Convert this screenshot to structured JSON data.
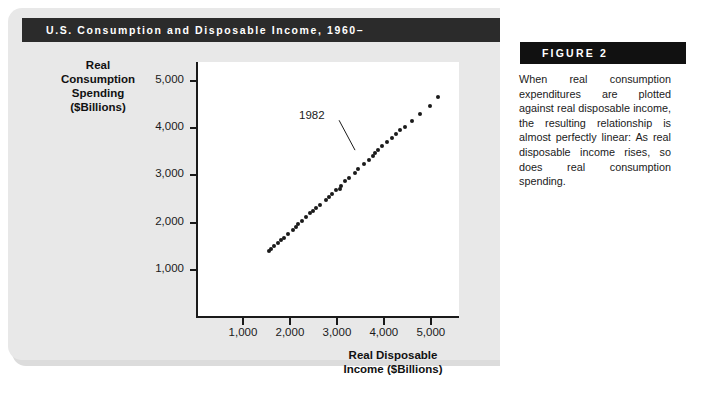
{
  "figure": {
    "title": "U.S. Consumption and Disposable Income, 1960–",
    "label": "FIGURE 2",
    "caption": "When real consumption expenditures are plotted against real disposable income, the resulting relationship is almost perfectly linear: As real disposable income rises, so does real consumption spending."
  },
  "chart_data": {
    "type": "scatter",
    "title": "U.S. Consumption and Disposable Income, 1960–",
    "xlabel": "Real Disposable Income ($Billions)",
    "ylabel": "Real Consumption Spending ($Billions)",
    "xlim": [
      0,
      5600
    ],
    "ylim": [
      0,
      5400
    ],
    "xticks": [
      1000,
      2000,
      3000,
      4000,
      5000
    ],
    "yticks": [
      1000,
      2000,
      3000,
      4000,
      5000
    ],
    "xtick_labels": [
      "1,000",
      "2,000",
      "3,000",
      "4,000",
      "5,000"
    ],
    "ytick_labels": [
      "1,000",
      "2,000",
      "3,000",
      "4,000",
      "5,000"
    ],
    "grid": false,
    "legend": null,
    "annotations": [
      {
        "text": "1982",
        "point_x": 3450,
        "point_y": 3470,
        "label_x": 2450,
        "label_y": 4230
      }
    ],
    "series": [
      {
        "name": "Real consumption spending vs. real disposable income",
        "x": [
          1550,
          1600,
          1660,
          1740,
          1820,
          1870,
          1960,
          2060,
          2130,
          2180,
          2260,
          2350,
          2430,
          2490,
          2560,
          2630,
          2770,
          2840,
          2900,
          2980,
          3070,
          3090,
          3170,
          3260,
          3390,
          3450,
          3570,
          3680,
          3770,
          3820,
          3880,
          3960,
          4060,
          4180,
          4260,
          4350,
          4450,
          4600,
          4780,
          4990,
          5150
        ],
        "y": [
          1400,
          1450,
          1500,
          1560,
          1630,
          1680,
          1750,
          1840,
          1910,
          1960,
          2040,
          2120,
          2200,
          2250,
          2310,
          2370,
          2480,
          2550,
          2610,
          2690,
          2710,
          2780,
          2870,
          2950,
          3050,
          3140,
          3230,
          3330,
          3400,
          3470,
          3540,
          3620,
          3700,
          3790,
          3880,
          3950,
          4030,
          4150,
          4300,
          4470,
          4650
        ]
      }
    ]
  }
}
